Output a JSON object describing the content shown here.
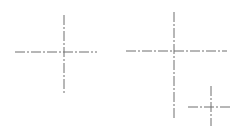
{
  "diagram": {
    "title": "",
    "line_color": "#6e6e6e",
    "dash_pattern": "10 2 2 2",
    "crosses": [
      {
        "name": "centerline-cross-1",
        "horizontal": {
          "x1": 15,
          "y1": 52,
          "x2": 97,
          "y2": 52
        },
        "vertical": {
          "x1": 64,
          "y1": 15,
          "x2": 64,
          "y2": 93
        }
      },
      {
        "name": "centerline-cross-2",
        "horizontal": {
          "x1": 126,
          "y1": 51,
          "x2": 227,
          "y2": 51
        },
        "vertical": {
          "x1": 174,
          "y1": 12,
          "x2": 174,
          "y2": 118
        }
      },
      {
        "name": "centerline-cross-3",
        "horizontal": {
          "x1": 188,
          "y1": 107,
          "x2": 231,
          "y2": 107
        },
        "vertical": {
          "x1": 211,
          "y1": 86,
          "x2": 211,
          "y2": 126
        }
      }
    ]
  }
}
